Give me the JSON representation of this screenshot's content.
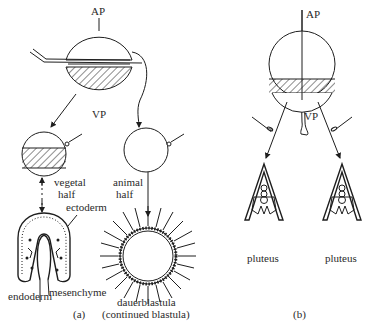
{
  "panel_a": {
    "caption": "(a)",
    "top_labels": {
      "animal_pole": "AP",
      "vegetal_pole": "VP"
    },
    "vegetal_half_label": [
      "vegetal",
      "half"
    ],
    "animal_half_label": [
      "animal",
      "half"
    ],
    "vegetal_result_labels": {
      "ectoderm": "ectoderm",
      "mesenchyme": "mesenchyme",
      "endoderm": "endoderm"
    },
    "animal_result_label": [
      "dauerblastula",
      "(continued blastula)"
    ]
  },
  "panel_b": {
    "caption": "(b)",
    "top_labels": {
      "animal_pole": "AP",
      "vegetal_pole": "VP"
    },
    "result_labels": [
      "pluteus",
      "pluteus"
    ]
  },
  "colors": {
    "ink": "#1e1e1e",
    "background": "#ffffff"
  }
}
